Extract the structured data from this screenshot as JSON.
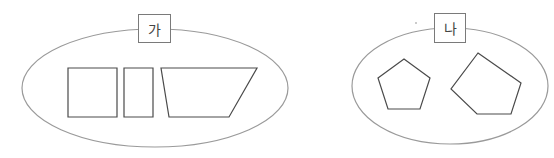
{
  "groups": [
    {
      "label": "가",
      "shapes": [
        {
          "type": "square",
          "points": "68,68 117,68 117,117 68,117"
        },
        {
          "type": "rectangle",
          "points": "124,68 153,68 153,117 124,117"
        },
        {
          "type": "trapezoid",
          "points": "161,68 257,68 229,117 169,117"
        }
      ]
    },
    {
      "label": "나",
      "shapes": [
        {
          "type": "pentagon",
          "points": "404,59 430,78 420,109 388,109 378,78"
        },
        {
          "type": "pentagon",
          "points": "478,53 521,83 511,114 477,114 451,89"
        }
      ]
    }
  ],
  "colors": {
    "ellipse_stroke": "#9a9a9a",
    "shape_stroke": "#4a4a4a",
    "label_border": "#7a7a7a"
  }
}
